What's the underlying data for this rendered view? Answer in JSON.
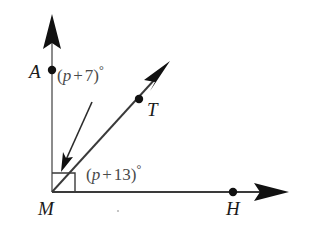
{
  "figure": {
    "background_color": "#ffffff",
    "line_color": "#2b2b2b",
    "light_line_color": "#8c8c8c",
    "text_color": "#1a1a1a",
    "angle_text_color": "#4a4a4a"
  },
  "points": [
    {
      "name": "A",
      "label": "A",
      "x": 52,
      "y": 70
    },
    {
      "name": "M",
      "label": "M",
      "x": 52,
      "y": 192
    },
    {
      "name": "T",
      "label": "T",
      "x": 139,
      "y": 99
    },
    {
      "name": "H",
      "label": "H",
      "x": 233,
      "y": 193
    }
  ],
  "labels": {
    "point_A": "A",
    "point_M": "M",
    "point_T": "T",
    "point_H": "H"
  },
  "angles": [
    {
      "name": "angle-AMT",
      "expression": "(p + 7)°",
      "open_paren": "(",
      "variable": "p",
      "operator": "+",
      "constant": "7",
      "close_paren": ")",
      "degree": "°"
    },
    {
      "name": "angle-TMH",
      "expression": "(p + 13)°",
      "open_paren": "(",
      "variable": "p",
      "operator": "+",
      "constant": "13",
      "close_paren": ")",
      "degree": "°"
    }
  ],
  "rays": [
    {
      "name": "ray-MA",
      "from": "M",
      "toward": "A",
      "arrow": true
    },
    {
      "name": "ray-MT",
      "from": "M",
      "toward": "T",
      "arrow": true
    },
    {
      "name": "ray-MH",
      "from": "M",
      "toward": "H",
      "arrow": true
    }
  ],
  "markers": {
    "angle_box": "square-angle-marker",
    "pointer": "leader-arrow"
  }
}
